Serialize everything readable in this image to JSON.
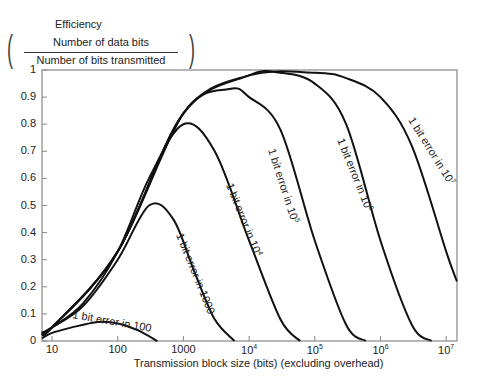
{
  "chart_data": {
    "type": "line",
    "title": "",
    "ylabel": "Efficiency (Number of data bits / Number of bits transmitted)",
    "ylabel_parts": {
      "title": "Efficiency",
      "numerator": "Number of data bits",
      "denominator": "Number of bits transmitted"
    },
    "xlabel": "Transmission block size (bits) (excluding overhead)",
    "xscale": "log",
    "xlim": [
      7,
      15000000
    ],
    "ylim": [
      0,
      1
    ],
    "grid": false,
    "legend": "inline labels on curves",
    "yticks": [
      "0",
      "0.1",
      "0.2",
      "0.3",
      "0.4",
      "0.5",
      "0.6",
      "0.7",
      "0.8",
      "0.9",
      "1"
    ],
    "xticks": [
      {
        "base": "10",
        "exp": ""
      },
      {
        "base": "100",
        "exp": ""
      },
      {
        "base": "1000",
        "exp": ""
      },
      {
        "base": "10",
        "exp": "4"
      },
      {
        "base": "10",
        "exp": "5"
      },
      {
        "base": "10",
        "exp": "6"
      },
      {
        "base": "10",
        "exp": "7"
      }
    ],
    "series": [
      {
        "name": "1 bit error in 100",
        "label_base": "1 bit error in 100",
        "label_exp": "",
        "x": [
          7,
          10,
          20,
          50,
          100,
          200,
          400
        ],
        "y": [
          0.01,
          0.03,
          0.05,
          0.07,
          0.065,
          0.04,
          0.0
        ]
      },
      {
        "name": "1 bit error in 1000",
        "label_base": "1 bit error in 1000",
        "label_exp": "",
        "x": [
          7,
          10,
          30,
          100,
          300,
          700,
          1500,
          3000,
          6000
        ],
        "y": [
          0.03,
          0.05,
          0.13,
          0.3,
          0.5,
          0.45,
          0.25,
          0.08,
          0.0
        ]
      },
      {
        "name": "1 bit error in 10^4",
        "label_base": "1 bit error in 10",
        "label_exp": "4",
        "x": [
          7,
          10,
          30,
          100,
          300,
          1000,
          3000,
          10000,
          30000,
          60000
        ],
        "y": [
          0.03,
          0.05,
          0.14,
          0.33,
          0.6,
          0.8,
          0.7,
          0.37,
          0.08,
          0.0
        ]
      },
      {
        "name": "1 bit error in 10^5",
        "label_base": "1 bit error in 10",
        "label_exp": "5",
        "x": [
          7,
          10,
          100,
          1000,
          5000,
          10000,
          30000,
          100000,
          300000,
          600000
        ],
        "y": [
          0.03,
          0.05,
          0.33,
          0.84,
          0.93,
          0.9,
          0.78,
          0.37,
          0.06,
          0.0
        ]
      },
      {
        "name": "1 bit error in 10^6",
        "label_base": "1 bit error in 10",
        "label_exp": "6",
        "x": [
          7,
          10,
          100,
          1000,
          10000,
          30000,
          100000,
          300000,
          1000000,
          3000000,
          6000000
        ],
        "y": [
          0.03,
          0.05,
          0.33,
          0.84,
          0.98,
          0.99,
          0.95,
          0.8,
          0.37,
          0.06,
          0.0
        ]
      },
      {
        "name": "1 bit error in 10^7",
        "label_base": "1 bit error in 10",
        "label_exp": "7",
        "x": [
          7,
          10,
          100,
          1000,
          10000,
          100000,
          300000,
          1000000,
          3000000,
          10000000,
          15000000
        ],
        "y": [
          0.03,
          0.05,
          0.33,
          0.84,
          0.98,
          0.99,
          0.97,
          0.9,
          0.72,
          0.33,
          0.22
        ]
      }
    ]
  }
}
